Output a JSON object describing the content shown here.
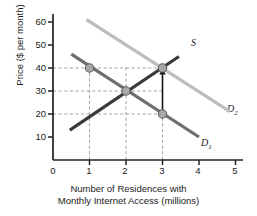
{
  "chart_data": {
    "type": "line",
    "title": "",
    "xlabel": "Number of Residences with Monthly Internet Access (millions)",
    "xlabel_line1": "Number of Residences with",
    "xlabel_line2": "Monthly Internet Access (millions)",
    "ylabel": "Price ($ per month)",
    "xlim": [
      0,
      5.35
    ],
    "ylim": [
      0,
      65
    ],
    "xticks": [
      "0",
      "1",
      "2",
      "3",
      "4",
      "5"
    ],
    "xtick_values": [
      0,
      1,
      2,
      3,
      4,
      5
    ],
    "yticks": [
      "10",
      "20",
      "30",
      "40",
      "50",
      "60"
    ],
    "ytick_values": [
      10,
      20,
      30,
      40,
      50,
      60
    ],
    "grid": "dashed-guides-only",
    "legend": "inline-curve-labels",
    "series": [
      {
        "name": "D1",
        "label": "D",
        "sub": "1",
        "role": "original-demand",
        "color": "#6e6e6e",
        "x": [
          0.5,
          4.0
        ],
        "y": [
          46,
          10
        ],
        "label_x": 4.18,
        "label_y": 9
      },
      {
        "name": "D2",
        "label": "D",
        "sub": "2",
        "role": "increased-demand",
        "color": "#bdbdbd",
        "x": [
          0.92,
          4.85
        ],
        "y": [
          61,
          21
        ],
        "label_x": 4.92,
        "label_y": 21
      },
      {
        "name": "S",
        "label": "S",
        "sub": "",
        "role": "supply",
        "color": "#3a3a3a",
        "x": [
          0.46,
          3.45
        ],
        "y": [
          13,
          45
        ],
        "label_x": 3.55,
        "label_y": 45.5
      }
    ],
    "points": [
      {
        "name": "original-equilibrium",
        "x": 2,
        "y": 30
      },
      {
        "name": "new-equilibrium",
        "x": 3,
        "y": 40
      },
      {
        "name": "old-demand-at-price-40",
        "x": 1,
        "y": 40
      },
      {
        "name": "old-demand-at-price-20",
        "x": 3,
        "y": 20
      }
    ],
    "guides": {
      "horizontal_values": [
        40,
        30,
        20
      ],
      "vertical_values": [
        1,
        2,
        3
      ],
      "color": "#9a9a9a",
      "style": "dashed"
    },
    "annotations": [
      {
        "name": "price-increase-arrow",
        "type": "arrow",
        "x": 3,
        "y_from": 20,
        "y_to": 40,
        "direction": "up",
        "color": "#111111"
      }
    ]
  },
  "axis": {
    "color": "#222222",
    "tick_length": 5
  }
}
